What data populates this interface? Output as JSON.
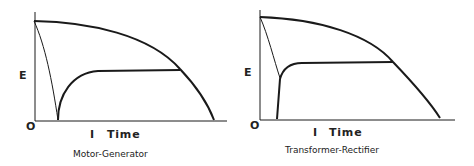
{
  "figures": [
    {
      "id": "motor-generator",
      "caption": "Motor-Generator",
      "y_label": "E",
      "origin_label": "O",
      "x_marker": "I",
      "x_label": "Time"
    },
    {
      "id": "transformer-rectifier",
      "caption": "Transformer-Rectifier",
      "y_label": "E",
      "origin_label": "O",
      "x_marker": "I",
      "x_label": "Time"
    }
  ],
  "colors": {
    "line": "#1a1a1a",
    "background": "#ffffff"
  }
}
